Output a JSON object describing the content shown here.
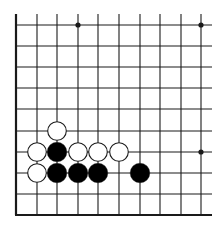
{
  "diagram": {
    "type": "go-board-fragment",
    "visible_columns": 10,
    "visible_rows": 10,
    "edges": [
      "left",
      "bottom"
    ],
    "colors": {
      "background": "#ffffff",
      "line": "#1a1a1a",
      "black_stone": "#000000",
      "white_stone": "#ffffff"
    },
    "grid": {
      "x": [
        16,
        37,
        57,
        78,
        98,
        119,
        140,
        160,
        181,
        201
      ],
      "y": [
        25,
        46,
        67,
        88,
        109,
        131,
        152,
        173,
        194,
        215
      ]
    },
    "star_points": [
      {
        "col": 3,
        "row": 0
      },
      {
        "col": 9,
        "row": 0
      },
      {
        "col": 9,
        "row": 6
      }
    ],
    "stones": [
      {
        "color": "white",
        "col": 2,
        "row": 5
      },
      {
        "color": "white",
        "col": 1,
        "row": 6
      },
      {
        "color": "black",
        "col": 2,
        "row": 6
      },
      {
        "color": "white",
        "col": 3,
        "row": 6
      },
      {
        "color": "white",
        "col": 4,
        "row": 6
      },
      {
        "color": "white",
        "col": 5,
        "row": 6
      },
      {
        "color": "white",
        "col": 1,
        "row": 7
      },
      {
        "color": "black",
        "col": 2,
        "row": 7
      },
      {
        "color": "black",
        "col": 3,
        "row": 7
      },
      {
        "color": "black",
        "col": 4,
        "row": 7
      },
      {
        "color": "black",
        "col": 6,
        "row": 7
      }
    ]
  }
}
